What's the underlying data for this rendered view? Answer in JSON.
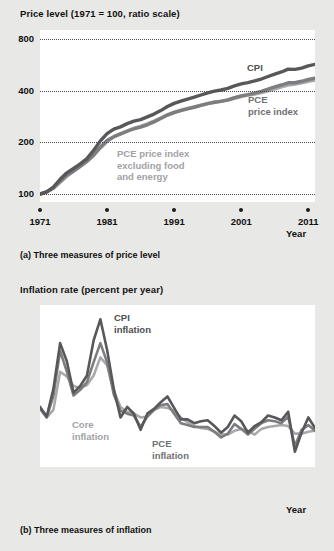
{
  "panel_a": {
    "axis_title": "Price level (1971 = 100, ratio scale)",
    "caption": "(a) Three measures of price level",
    "x_axis_label": "Year",
    "y_ticks": [
      "800",
      "400",
      "200",
      "100"
    ],
    "x_ticks": [
      "1971",
      "1981",
      "1991",
      "2001",
      "2011"
    ],
    "labels": {
      "cpi": "CPI",
      "pce_line1": "PCE",
      "pce_line2": "price index",
      "core_line1": "PCE price index",
      "core_line2": "excluding food",
      "core_line3": "and energy"
    }
  },
  "panel_b": {
    "axis_title": "Inflation rate (percent per year)",
    "caption": "(b) Three measures of inflation",
    "x_axis_label": "Year",
    "y_ticks": [
      "15",
      "10",
      "5",
      "0",
      "–2"
    ],
    "x_ticks": [
      "1971",
      "1981",
      "1991",
      "2001",
      "2011"
    ],
    "labels": {
      "cpi_line1": "CPI",
      "cpi_line2": "inflation",
      "core_line1": "Core",
      "core_line2": "inflation",
      "pce_line1": "PCE",
      "pce_line2": "inflation"
    }
  },
  "colors": {
    "cpi": "#58585a",
    "pce": "#7d7d80",
    "core": "#a9a9ac",
    "background": "#e8e8e6",
    "plot_background": "#ffffff",
    "text": "#1a1a1a",
    "gridline": "#4a4a4a"
  },
  "chart_data": [
    {
      "type": "line",
      "id": "price-level",
      "title": "Price level (1971 = 100, ratio scale)",
      "subtitle": "(a) Three measures of price level",
      "xlabel": "Year",
      "ylabel": "Price level (1971 = 100, ratio scale)",
      "yscale": "log",
      "ylim": [
        90,
        900
      ],
      "yticks": [
        100,
        200,
        400,
        800
      ],
      "xlim": [
        1971,
        2012
      ],
      "xticks": [
        1971,
        1981,
        1991,
        2001,
        2011
      ],
      "grid": "horizontal-dotted",
      "legend": "inline-annotations",
      "x": [
        1971,
        1972,
        1973,
        1974,
        1975,
        1976,
        1977,
        1978,
        1979,
        1980,
        1981,
        1982,
        1983,
        1984,
        1985,
        1986,
        1987,
        1988,
        1989,
        1990,
        1991,
        1992,
        1993,
        1994,
        1995,
        1996,
        1997,
        1998,
        1999,
        2000,
        2001,
        2002,
        2003,
        2004,
        2005,
        2006,
        2007,
        2008,
        2009,
        2010,
        2011,
        2012
      ],
      "series": [
        {
          "name": "CPI",
          "color": "#58585a",
          "values": [
            100,
            103,
            110,
            122,
            133,
            141,
            150,
            161,
            180,
            204,
            225,
            239,
            246,
            257,
            266,
            271,
            281,
            292,
            306,
            323,
            337,
            347,
            357,
            366,
            377,
            388,
            397,
            403,
            412,
            426,
            438,
            445,
            455,
            467,
            483,
            499,
            513,
            533,
            531,
            540,
            557,
            568
          ]
        },
        {
          "name": "PCE price index",
          "color": "#7d7d80",
          "values": [
            100,
            103,
            109,
            119,
            129,
            136,
            145,
            155,
            169,
            188,
            205,
            216,
            224,
            232,
            240,
            245,
            253,
            263,
            275,
            288,
            298,
            306,
            313,
            320,
            328,
            336,
            342,
            346,
            353,
            364,
            373,
            379,
            387,
            396,
            408,
            420,
            431,
            444,
            444,
            453,
            464,
            472
          ]
        },
        {
          "name": "PCE price index excluding food and energy",
          "color": "#a9a9ac",
          "values": [
            100,
            103,
            108,
            117,
            127,
            136,
            145,
            155,
            168,
            185,
            202,
            215,
            224,
            233,
            241,
            248,
            256,
            266,
            277,
            289,
            300,
            308,
            315,
            322,
            329,
            336,
            342,
            347,
            352,
            360,
            369,
            376,
            382,
            389,
            398,
            409,
            420,
            430,
            437,
            444,
            452,
            460
          ]
        }
      ],
      "annotations": [
        {
          "text": "CPI",
          "series": "CPI"
        },
        {
          "text": "PCE price index",
          "series": "PCE price index"
        },
        {
          "text": "PCE price index excluding food and energy",
          "series": "PCE price index excluding food and energy"
        }
      ]
    },
    {
      "type": "line",
      "id": "inflation-rate",
      "title": "Inflation rate (percent per year)",
      "subtitle": "(b) Three measures of inflation",
      "xlabel": "Year",
      "ylabel": "Inflation rate (percent per year)",
      "yscale": "linear",
      "ylim": [
        -2,
        15
      ],
      "yticks": [
        -2,
        0,
        5,
        10,
        15
      ],
      "xlim": [
        1971,
        2012
      ],
      "xticks": [
        1971,
        1981,
        1991,
        2001,
        2011
      ],
      "grid": "horizontal-dotted",
      "legend": "inline-annotations",
      "x": [
        1971,
        1972,
        1973,
        1974,
        1975,
        1976,
        1977,
        1978,
        1979,
        1980,
        1981,
        1982,
        1983,
        1984,
        1985,
        1986,
        1987,
        1988,
        1989,
        1990,
        1991,
        1992,
        1993,
        1994,
        1995,
        1996,
        1997,
        1998,
        1999,
        2000,
        2001,
        2002,
        2003,
        2004,
        2005,
        2006,
        2007,
        2008,
        2009,
        2010,
        2011,
        2012
      ],
      "series": [
        {
          "name": "CPI inflation",
          "color": "#58585a",
          "values": [
            4.3,
            3.3,
            6.2,
            11.0,
            9.1,
            5.8,
            6.5,
            7.6,
            11.3,
            13.5,
            10.3,
            6.2,
            3.2,
            4.3,
            3.6,
            1.9,
            3.6,
            4.1,
            4.8,
            5.4,
            4.2,
            3.0,
            3.0,
            2.6,
            2.8,
            2.9,
            2.3,
            1.6,
            2.2,
            3.4,
            2.8,
            1.6,
            2.3,
            2.7,
            3.4,
            3.2,
            2.9,
            3.8,
            -0.4,
            1.6,
            3.2,
            2.1
          ]
        },
        {
          "name": "PCE inflation",
          "color": "#7d7d80",
          "values": [
            4.1,
            3.2,
            5.5,
            10.2,
            8.0,
            5.5,
            6.1,
            6.9,
            9.0,
            11.0,
            9.0,
            5.6,
            3.9,
            3.6,
            3.4,
            2.2,
            3.3,
            4.0,
            4.5,
            4.6,
            3.6,
            2.6,
            2.4,
            2.2,
            2.2,
            2.2,
            1.7,
            1.1,
            1.5,
            2.5,
            2.0,
            1.4,
            2.0,
            2.6,
            2.9,
            2.8,
            2.6,
            3.3,
            0.2,
            1.9,
            2.4,
            1.8
          ]
        },
        {
          "name": "Core inflation",
          "color": "#a9a9ac",
          "values": [
            4.3,
            3.2,
            4.0,
            8.0,
            7.5,
            6.5,
            6.3,
            6.6,
            7.6,
            9.5,
            8.7,
            6.0,
            4.3,
            3.8,
            3.6,
            3.2,
            3.3,
            4.0,
            4.3,
            4.2,
            3.9,
            3.2,
            2.7,
            2.3,
            2.1,
            2.0,
            1.7,
            1.4,
            1.4,
            1.8,
            2.0,
            1.8,
            1.4,
            2.0,
            2.2,
            2.3,
            2.4,
            2.3,
            1.5,
            1.5,
            1.7,
            1.8
          ]
        }
      ],
      "annotations": [
        {
          "text": "CPI inflation",
          "series": "CPI inflation"
        },
        {
          "text": "Core inflation",
          "series": "Core inflation"
        },
        {
          "text": "PCE inflation",
          "series": "PCE inflation"
        }
      ]
    }
  ]
}
